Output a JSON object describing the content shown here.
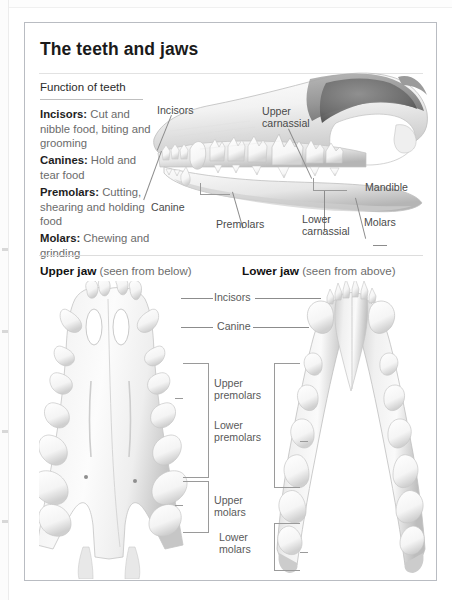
{
  "panel": {
    "title": "The teeth and jaws"
  },
  "function_of_teeth": {
    "heading": "Function of teeth",
    "entries": [
      {
        "term": "Incisors:",
        "text": " Cut and nibble food, biting and grooming"
      },
      {
        "term": "Canines:",
        "text": " Hold and tear food"
      },
      {
        "term": "Premolars:",
        "text": " Cutting, shearing and holding food"
      },
      {
        "term": "Molars:",
        "text": " Chewing and grinding"
      }
    ]
  },
  "skull_diagram": {
    "labels": {
      "incisors": "Incisors",
      "upper_carnassial": "Upper\ncarnassial",
      "mandible": "Mandible",
      "canine": "Canine",
      "premolars": "Premolars",
      "lower_carnassial": "Lower\ncarnassial",
      "molars": "Molars"
    }
  },
  "jaw_section": {
    "upper_jaw": {
      "name": "Upper jaw",
      "view": " (seen from below)"
    },
    "lower_jaw": {
      "name": "Lower jaw",
      "view": " (seen from above)"
    },
    "labels": {
      "incisors": "Incisors",
      "canine": "Canine",
      "upper_premolars": "Upper\npremolars",
      "lower_premolars": "Lower\npremolars",
      "upper_molars": "Upper\nmolars",
      "lower_molars": "Lower\nmolars"
    }
  },
  "colors": {
    "panel_border": "#b9bcc2",
    "title_text": "#1a1a1a",
    "body_text": "#6b6b6b",
    "term_text": "#1e1e1e",
    "anno_text": "#4a4a4a",
    "leader_line": "#8c8c8c",
    "page_background": "#ffffff"
  }
}
